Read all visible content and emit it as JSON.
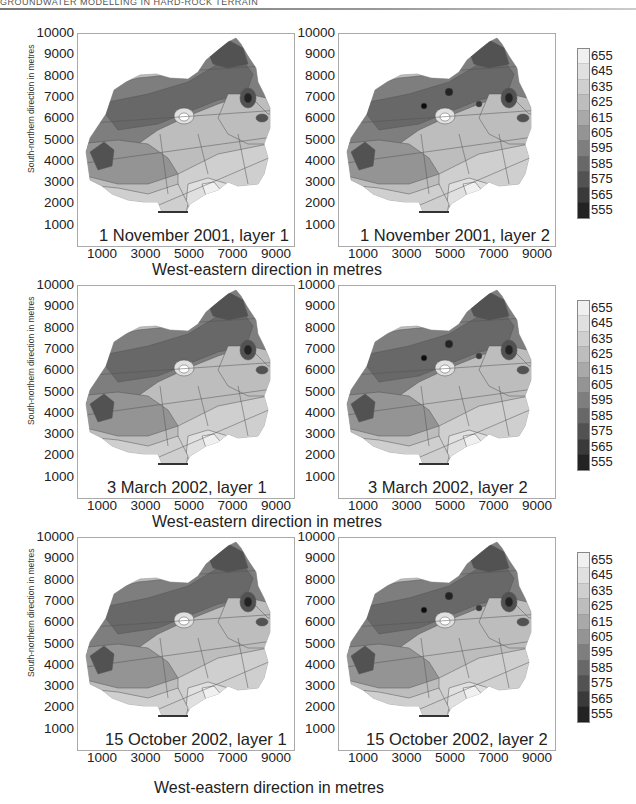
{
  "header": {
    "running_title": "GROUNDWATER MODELLING IN HARD-ROCK TERRAIN"
  },
  "axes": {
    "y_label": "South-northern direction in metres",
    "x_label": "West-eastern direction in metres",
    "y_ticks": [
      "10000",
      "9000",
      "8000",
      "7000",
      "6000",
      "5000",
      "4000",
      "3000",
      "2000",
      "1000"
    ],
    "x_ticks": [
      "1000",
      "3000",
      "5000",
      "7000",
      "9000"
    ]
  },
  "legend": {
    "labels": [
      "655",
      "645",
      "635",
      "625",
      "615",
      "605",
      "595",
      "585",
      "575",
      "565",
      "555"
    ],
    "colors": [
      "#ffffff",
      "#f0f0f0",
      "#e0e0e0",
      "#cfcfcf",
      "#bdbdbd",
      "#a9a9a9",
      "#949494",
      "#7e7e7e",
      "#686868",
      "#525252",
      "#3a3a3a",
      "#232323",
      "#0d0d0d"
    ]
  },
  "panels": [
    {
      "title": "1 November 2001, layer 1"
    },
    {
      "title": "1 November 2001, layer 2"
    },
    {
      "title": "3 March 2002, layer 1"
    },
    {
      "title": "3 March 2002, layer 2"
    },
    {
      "title": "15 October 2002, layer 1"
    },
    {
      "title": "15 October 2002, layer 2"
    }
  ],
  "chart_data": {
    "type": "heatmap",
    "xlabel": "West-eastern direction in metres",
    "ylabel": "South-northern direction in metres",
    "xlim": [
      0,
      10000
    ],
    "ylim": [
      0,
      10000
    ],
    "x_ticks": [
      1000,
      3000,
      5000,
      7000,
      9000
    ],
    "y_ticks": [
      1000,
      2000,
      3000,
      4000,
      5000,
      6000,
      7000,
      8000,
      9000,
      10000
    ],
    "colorbar": {
      "min": 555,
      "max": 655,
      "step": 10,
      "labels": [
        655,
        645,
        635,
        625,
        615,
        605,
        595,
        585,
        575,
        565,
        555
      ],
      "colormap": "grayscale (dark=low, light=high)"
    },
    "grid": false,
    "panels": [
      {
        "title": "1 November 2001, layer 1",
        "row": 1,
        "col": 1
      },
      {
        "title": "1 November 2001, layer 2",
        "row": 1,
        "col": 2
      },
      {
        "title": "3 March 2002, layer 1",
        "row": 2,
        "col": 1
      },
      {
        "title": "3 March 2002, layer 2",
        "row": 2,
        "col": 2
      },
      {
        "title": "15 October 2002, layer 1",
        "row": 3,
        "col": 1
      },
      {
        "title": "15 October 2002, layer 2",
        "row": 3,
        "col": 2
      }
    ]
  }
}
